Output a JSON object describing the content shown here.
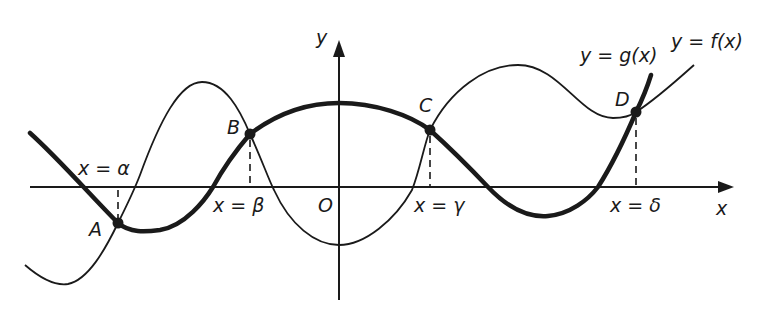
{
  "header": {
    "cropped_text": "hypothesis y = f(x) ... hypothesis y = g(x) ..."
  },
  "axes": {
    "x_label": "x",
    "y_label": "y",
    "origin_label": "O"
  },
  "curves": {
    "f": {
      "label": "y = f(x)",
      "style": "thin"
    },
    "g": {
      "label": "y = g(x)",
      "style": "thick"
    }
  },
  "points": [
    {
      "id": "A",
      "label": "A",
      "x_label": "x = α"
    },
    {
      "id": "B",
      "label": "B",
      "x_label": "x = β"
    },
    {
      "id": "C",
      "label": "C",
      "x_label": "x = γ"
    },
    {
      "id": "D",
      "label": "D",
      "x_label": "x = δ"
    }
  ],
  "colors": {
    "ink": "#1a1a1a",
    "background": "#ffffff"
  }
}
